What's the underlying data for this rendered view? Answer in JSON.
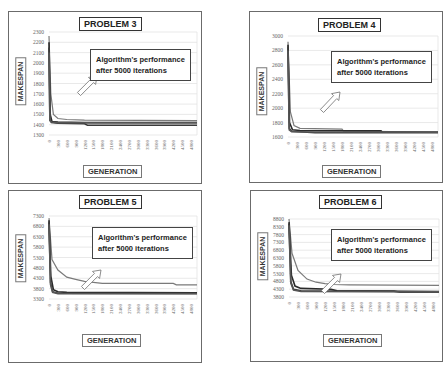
{
  "annotation_text_line1": "Algorithm's performance",
  "annotation_text_line2": "after 5000 iterations",
  "x_axis_label": "GENERATION",
  "y_axis_label": "MAKESPAN",
  "panels": [
    {
      "title": "PROBLEM 3"
    },
    {
      "title": "PROBLEM 4"
    },
    {
      "title": "PROBLEM 5"
    },
    {
      "title": "PROBLEM 6"
    }
  ],
  "chart_data": [
    {
      "type": "line",
      "title": "PROBLEM 3",
      "xlabel": "GENERATION",
      "ylabel": "MAKESPAN",
      "x_ticks": [
        0,
        300,
        600,
        900,
        1200,
        1500,
        1800,
        2100,
        2400,
        2700,
        3000,
        3300,
        3600,
        3900,
        4200,
        4500,
        4800
      ],
      "y_ticks": [
        1300,
        1400,
        1500,
        1600,
        1700,
        1800,
        1900,
        2000,
        2100,
        2200,
        2300
      ],
      "ylim": [
        1300,
        2300
      ],
      "xlim": [
        0,
        5000
      ],
      "grid": true,
      "annotation": "Algorithm's performance after 5000 iterations",
      "series": [
        {
          "name": "run 1",
          "x": [
            0,
            60,
            150,
            300,
            600,
            1200,
            5000
          ],
          "y": [
            2260,
            1700,
            1500,
            1460,
            1450,
            1445,
            1440
          ]
        },
        {
          "name": "run 2",
          "x": [
            0,
            40,
            100,
            300,
            1200,
            5000
          ],
          "y": [
            2200,
            1500,
            1430,
            1425,
            1420,
            1420
          ]
        },
        {
          "name": "run 3",
          "x": [
            0,
            30,
            80,
            300,
            1200,
            1300,
            5000
          ],
          "y": [
            2150,
            1450,
            1420,
            1415,
            1410,
            1395,
            1395
          ]
        },
        {
          "name": "run 4",
          "x": [
            0,
            30,
            80,
            300,
            5000
          ],
          "y": [
            2100,
            1440,
            1425,
            1420,
            1418
          ]
        }
      ]
    },
    {
      "type": "line",
      "title": "PROBLEM 4",
      "xlabel": "GENERATION",
      "ylabel": "MAKESPAN",
      "x_ticks": [
        0,
        300,
        600,
        900,
        1200,
        1500,
        1800,
        2100,
        2400,
        2700,
        3000,
        3300,
        3600,
        3900,
        4200,
        4500,
        4800
      ],
      "y_ticks": [
        1600,
        1800,
        2000,
        2200,
        2400,
        2600,
        2800,
        3000
      ],
      "ylim": [
        1600,
        3000
      ],
      "xlim": [
        0,
        5000
      ],
      "grid": true,
      "annotation": "Algorithm's performance after 5000 iterations",
      "series": [
        {
          "name": "run 1",
          "x": [
            0,
            80,
            200,
            400,
            1800,
            1850,
            5000
          ],
          "y": [
            2920,
            1950,
            1760,
            1720,
            1710,
            1680,
            1670
          ]
        },
        {
          "name": "run 2",
          "x": [
            0,
            50,
            150,
            400,
            3100,
            3150,
            5000
          ],
          "y": [
            2880,
            1800,
            1700,
            1690,
            1685,
            1665,
            1665
          ]
        },
        {
          "name": "run 3",
          "x": [
            0,
            40,
            120,
            900,
            5000
          ],
          "y": [
            2850,
            1720,
            1680,
            1660,
            1660
          ]
        },
        {
          "name": "run 4",
          "x": [
            0,
            40,
            120,
            600,
            5000
          ],
          "y": [
            2800,
            1700,
            1675,
            1670,
            1668
          ]
        }
      ]
    },
    {
      "type": "line",
      "title": "PROBLEM 5",
      "xlabel": "GENERATION",
      "ylabel": "MAKESPAN",
      "x_ticks": [
        0,
        300,
        600,
        900,
        1200,
        1500,
        1800,
        2100,
        2400,
        2700,
        3000,
        3300,
        3600,
        3900,
        4200,
        4500,
        4800
      ],
      "y_ticks": [
        3300,
        3800,
        4300,
        4800,
        5300,
        5800,
        6300,
        6800,
        7300
      ],
      "ylim": [
        3300,
        7300
      ],
      "xlim": [
        0,
        5000
      ],
      "grid": true,
      "annotation": "Algorithm's performance after 5000 iterations",
      "series": [
        {
          "name": "run 1",
          "x": [
            0,
            100,
            300,
            600,
            900,
            1200,
            1500,
            1800,
            4200,
            4300,
            5000
          ],
          "y": [
            7200,
            5200,
            4700,
            4350,
            4250,
            4150,
            4100,
            4050,
            4050,
            3980,
            3980
          ]
        },
        {
          "name": "run 2",
          "x": [
            0,
            60,
            150,
            300,
            600,
            5000
          ],
          "y": [
            7100,
            4400,
            3750,
            3650,
            3620,
            3600
          ]
        },
        {
          "name": "run 3",
          "x": [
            0,
            50,
            120,
            300,
            5000
          ],
          "y": [
            7000,
            4100,
            3650,
            3580,
            3570
          ]
        },
        {
          "name": "run 4",
          "x": [
            0,
            50,
            120,
            300,
            5000
          ],
          "y": [
            6900,
            4000,
            3620,
            3560,
            3550
          ]
        }
      ]
    },
    {
      "type": "line",
      "title": "PROBLEM 6",
      "xlabel": "GENERATION",
      "ylabel": "MAKESPAN",
      "x_ticks": [
        0,
        300,
        600,
        900,
        1200,
        1500,
        1800,
        2100,
        2400,
        2700,
        3000,
        3300,
        3600,
        3900,
        4200,
        4500,
        4800
      ],
      "y_ticks": [
        3800,
        4300,
        4800,
        5300,
        5800,
        6300,
        6800,
        7300,
        7800,
        8300,
        8800
      ],
      "ylim": [
        3800,
        8800
      ],
      "xlim": [
        0,
        5000
      ],
      "grid": true,
      "annotation": "Algorithm's performance after 5000 iterations",
      "series": [
        {
          "name": "run 1",
          "x": [
            0,
            100,
            300,
            600,
            900,
            1200,
            1500,
            2000,
            5000
          ],
          "y": [
            8800,
            6600,
            5500,
            4950,
            4750,
            4650,
            4600,
            4580,
            4550
          ]
        },
        {
          "name": "run 2",
          "x": [
            0,
            80,
            200,
            400,
            1400,
            1600,
            5000
          ],
          "y": [
            8600,
            5200,
            4500,
            4350,
            4300,
            4200,
            4150
          ]
        },
        {
          "name": "run 3",
          "x": [
            0,
            60,
            150,
            400,
            3500,
            3700,
            5000
          ],
          "y": [
            8500,
            4800,
            4300,
            4200,
            4180,
            4100,
            4100
          ]
        },
        {
          "name": "run 4",
          "x": [
            0,
            60,
            150,
            400,
            5000
          ],
          "y": [
            8400,
            4700,
            4250,
            4150,
            4130
          ]
        }
      ]
    }
  ]
}
